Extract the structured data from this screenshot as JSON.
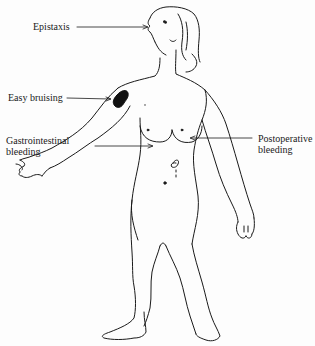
{
  "diagram": {
    "labels": [
      {
        "id": "epistaxis",
        "text": "Epistaxis"
      },
      {
        "id": "easy-bruising",
        "text": "Easy bruising"
      },
      {
        "id": "gastrointestinal-bleeding",
        "lines": [
          "Gastrointestinal",
          "bleeding"
        ]
      },
      {
        "id": "postoperative-bleeding",
        "lines": [
          "Postoperative",
          "bleeding"
        ]
      }
    ],
    "colors": {
      "ink": "#1a1a1a",
      "background": "#fdfdfd",
      "bruise": "#111111"
    }
  }
}
